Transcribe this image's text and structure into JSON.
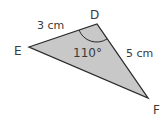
{
  "diagram": {
    "type": "triangle",
    "vertices": {
      "D": {
        "label": "D"
      },
      "E": {
        "label": "E"
      },
      "F": {
        "label": "F"
      }
    },
    "sides": {
      "DE": {
        "label": "3 cm"
      },
      "DF": {
        "label": "5 cm"
      }
    },
    "angle_D": {
      "label": "110°"
    },
    "colors": {
      "fill": "#c8c8c8",
      "stroke": "#2a2a2a",
      "text": "#3a3a3a"
    }
  }
}
